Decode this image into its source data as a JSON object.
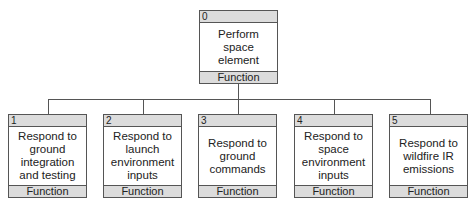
{
  "root": {
    "id": "0",
    "label": "Perform space element",
    "type": "Function"
  },
  "children": [
    {
      "id": "1",
      "label": "Respond to ground integration and testing",
      "type": "Function"
    },
    {
      "id": "2",
      "label": "Respond to launch environment inputs",
      "type": "Function"
    },
    {
      "id": "3",
      "label": "Respond to ground commands",
      "type": "Function"
    },
    {
      "id": "4",
      "label": "Respond to space environment inputs",
      "type": "Function"
    },
    {
      "id": "5",
      "label": "Respond to wildfire IR emissions",
      "type": "Function"
    }
  ]
}
